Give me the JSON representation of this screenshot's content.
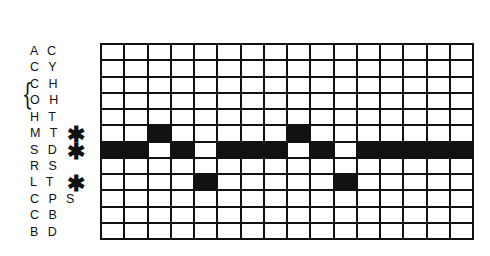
{
  "diagram": {
    "columns": 16,
    "rows": [
      {
        "label": "A C",
        "marked": false,
        "filled": []
      },
      {
        "label": "C Y",
        "marked": false,
        "filled": []
      },
      {
        "label": "C H",
        "marked": false,
        "filled": [],
        "bracket": true
      },
      {
        "label": "O H",
        "marked": false,
        "filled": [],
        "bracket": true
      },
      {
        "label": "H T",
        "marked": false,
        "filled": []
      },
      {
        "label": "M T",
        "marked": true,
        "filled": [
          3,
          9
        ]
      },
      {
        "label": "S D",
        "marked": true,
        "filled": [
          1,
          2,
          4,
          6,
          7,
          8,
          10,
          12,
          13,
          14,
          15,
          16
        ]
      },
      {
        "label": "R S",
        "marked": false,
        "filled": []
      },
      {
        "label": "L T",
        "marked": true,
        "filled": [
          5,
          11
        ]
      },
      {
        "label": "C P S",
        "marked": false,
        "filled": []
      },
      {
        "label": "C B",
        "marked": false,
        "filled": []
      },
      {
        "label": "B D",
        "marked": false,
        "filled": []
      }
    ],
    "marker_symbol": "✱",
    "bracket_symbol": "{",
    "fill_color": "#111111",
    "empty_color": "#ffffff"
  }
}
